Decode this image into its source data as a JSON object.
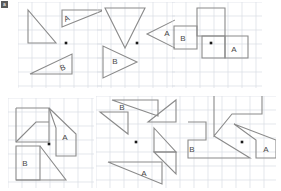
{
  "canvas": {
    "width": 281,
    "height": 191,
    "background": "#ffffff",
    "corner_mark_label": "a"
  },
  "style": {
    "grid_color": "#d8dce4",
    "grid_spacing": 14,
    "shape_stroke": "#8a8a8a",
    "shape_stroke_width": 1.1,
    "shape_fill": "none",
    "center_dot_color": "#1a1a1a",
    "label_color": "#4a4a4a",
    "label_font_size": 8,
    "separator_color": "#e2e2e2"
  },
  "layout": {
    "rows": 2,
    "cols": 3,
    "description": "Six grid panels each showing outlined geometric shapes with a central black dot and letter-labelled sub-regions"
  },
  "panels": [
    {
      "id": "panel-1",
      "name": "top-left-triangles",
      "x": 18,
      "y": 2,
      "w": 84,
      "h": 86,
      "center_dot": {
        "x": 48,
        "y": 41
      },
      "shapes": [
        {
          "name": "plain-right-triangle",
          "type": "polygon",
          "points": "10,8 10,41 38,41"
        },
        {
          "name": "triangle-a",
          "type": "polygon",
          "points": "44,8 86,8 44,25"
        },
        {
          "name": "triangle-b",
          "type": "polygon",
          "points": "12,72 54,72 54,52"
        }
      ],
      "labels": [
        {
          "name": "label-a",
          "text": "A",
          "x": 49,
          "y": 17,
          "rotate": -22
        },
        {
          "name": "label-b",
          "text": "B",
          "x": 45,
          "y": 66,
          "rotate": -22
        }
      ]
    },
    {
      "id": "panel-2",
      "name": "top-center-triangles",
      "x": 97,
      "y": 2,
      "w": 78,
      "h": 86,
      "center_dot": {
        "x": 40,
        "y": 41
      },
      "shapes": [
        {
          "name": "triangle-down",
          "type": "polygon",
          "points": "8,6 48,6 28,46"
        },
        {
          "name": "triangle-a-left",
          "type": "polygon",
          "points": "82,16 82,48 50,32"
        },
        {
          "name": "triangle-b-right",
          "type": "polygon",
          "points": "6,44 6,76 40,60"
        }
      ],
      "labels": [
        {
          "name": "label-a",
          "text": "A",
          "x": 70,
          "y": 32,
          "rotate": 0
        },
        {
          "name": "label-b",
          "text": "B",
          "x": 18,
          "y": 60,
          "rotate": 0
        }
      ]
    },
    {
      "id": "panel-3",
      "name": "top-right-squares",
      "x": 172,
      "y": 2,
      "w": 90,
      "h": 86,
      "center_dot": {
        "x": 39,
        "y": 41
      },
      "shapes": [
        {
          "name": "square-top",
          "type": "polygon",
          "points": "25,6 53,6 53,34 25,34"
        },
        {
          "name": "square-b",
          "type": "polygon",
          "points": "2,24 25,24 25,47 2,47"
        },
        {
          "name": "square-a",
          "type": "polygon",
          "points": "53,34 53,56 30,56 30,34"
        },
        {
          "name": "square-a-outline",
          "type": "polygon",
          "points": "53,34 76,34 76,56 53,56"
        }
      ],
      "labels": [
        {
          "name": "label-b",
          "text": "B",
          "x": 11,
          "y": 37,
          "rotate": 0
        },
        {
          "name": "label-a",
          "text": "A",
          "x": 62,
          "y": 48,
          "rotate": 0
        }
      ]
    },
    {
      "id": "panel-4",
      "name": "bottom-left-polygon",
      "x": 8,
      "y": 98,
      "w": 86,
      "h": 90,
      "center_dot": {
        "x": 41,
        "y": 46
      },
      "shapes": [
        {
          "name": "polygon-main-outline",
          "type": "polyline",
          "points": "8,10 8,44 41,44 41,10 8,10"
        },
        {
          "name": "notch-diagonal-upper",
          "type": "polyline",
          "points": "8,44 28,24 41,24"
        },
        {
          "name": "polygon-a-region",
          "type": "polyline",
          "points": "41,10 68,36 68,58 48,58 48,30 41,10"
        },
        {
          "name": "square-b",
          "type": "polygon",
          "points": "8,48 32,48 32,82 8,82"
        },
        {
          "name": "b-diagonal",
          "type": "polyline",
          "points": "32,48 58,82 8,82"
        }
      ],
      "labels": [
        {
          "name": "label-a",
          "text": "A",
          "x": 57,
          "y": 40,
          "rotate": 0
        },
        {
          "name": "label-b",
          "text": "B",
          "x": 17,
          "y": 66,
          "rotate": 0
        }
      ]
    },
    {
      "id": "panel-5",
      "name": "bottom-center-triangles",
      "x": 96,
      "y": 96,
      "w": 84,
      "h": 92,
      "center_dot": {
        "x": 40,
        "y": 46
      },
      "shapes": [
        {
          "name": "triangle-b-top",
          "type": "polygon",
          "points": "16,4 62,4 62,20"
        },
        {
          "name": "triangle-top-left-tail",
          "type": "polygon",
          "points": "4,16 32,16 32,38"
        },
        {
          "name": "triangle-right-upper",
          "type": "polygon",
          "points": "52,26 80,26 80,4"
        },
        {
          "name": "triangle-right-lower",
          "type": "polygon",
          "points": "58,32 80,56 58,56"
        },
        {
          "name": "triangle-a-bottom",
          "type": "polygon",
          "points": "12,66 66,66 66,88"
        },
        {
          "name": "triangle-bottom-right",
          "type": "polygon",
          "points": "58,56 80,56 80,78"
        }
      ],
      "labels": [
        {
          "name": "label-b",
          "text": "B",
          "x": 26,
          "y": 12,
          "rotate": 0
        },
        {
          "name": "label-a",
          "text": "A",
          "x": 48,
          "y": 78,
          "rotate": 0
        }
      ]
    },
    {
      "id": "panel-6",
      "name": "bottom-right-polygon",
      "x": 180,
      "y": 96,
      "w": 96,
      "h": 92,
      "center_dot": {
        "x": 62,
        "y": 46
      },
      "shapes": [
        {
          "name": "polygon-top-block",
          "type": "polyline",
          "points": "34,0 34,40 52,18 82,18 82,0"
        },
        {
          "name": "polygon-b-left",
          "type": "polyline",
          "points": "8,26 26,26 26,44 8,44 8,62 70,62 34,40"
        },
        {
          "name": "polygon-a-right",
          "type": "polyline",
          "points": "54,28 96,44 96,62 76,62 76,44 54,28"
        }
      ],
      "labels": [
        {
          "name": "label-b",
          "text": "B",
          "x": 12,
          "y": 54,
          "rotate": 0
        },
        {
          "name": "label-a",
          "text": "A",
          "x": 86,
          "y": 54,
          "rotate": 0
        }
      ]
    }
  ]
}
